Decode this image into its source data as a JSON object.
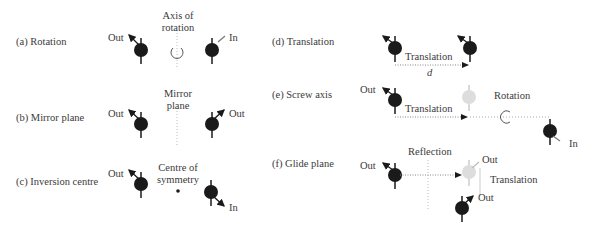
{
  "panels": {
    "a": {
      "title": "(a) Rotation",
      "axis_label_1": "Axis of",
      "axis_label_2": "rotation",
      "left_label": "Out",
      "right_label": "In"
    },
    "b": {
      "title": "(b) Mirror plane",
      "plane_label_1": "Mirror",
      "plane_label_2": "plane",
      "left_label": "Out",
      "right_label": "Out"
    },
    "c": {
      "title": "(c) Inversion centre",
      "centre_label_1": "Centre of",
      "centre_label_2": "symmetry",
      "left_label": "Out",
      "right_label": "In"
    },
    "d": {
      "title": "(d) Translation",
      "arrow_label": "Translation",
      "distance_label": "d"
    },
    "e": {
      "title": "(e) Screw axis",
      "left_label": "Out",
      "translation_label": "Translation",
      "rotation_label": "Rotation",
      "right_label": "In"
    },
    "f": {
      "title": "(f) Glide plane",
      "left_label": "Out",
      "reflection_label": "Reflection",
      "ghost_label": "Out",
      "translation_label": "Translation",
      "final_label": "Out"
    }
  },
  "colors": {
    "molecule": "#1a1a1a",
    "ghost": "#d8d8d8",
    "guide": "#9a9a9a",
    "text": "#3a3a3a"
  }
}
